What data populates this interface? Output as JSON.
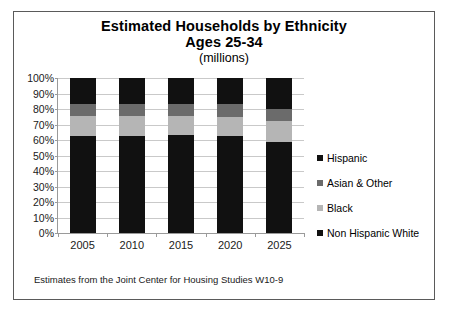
{
  "chart_data": {
    "type": "bar",
    "subtype": "stacked-percentage",
    "title": "Estimated Households by Ethnicity",
    "title_line2": "Ages 25-34",
    "subtitle": "(millions)",
    "xlabel": "",
    "ylabel": "",
    "categories": [
      "2005",
      "2010",
      "2015",
      "2020",
      "2025"
    ],
    "ylim": [
      0,
      100
    ],
    "ytick_labels": [
      "0%",
      "10%",
      "20%",
      "30%",
      "40%",
      "50%",
      "60%",
      "70%",
      "80%",
      "90%",
      "100%"
    ],
    "ytick_values": [
      0,
      10,
      20,
      30,
      40,
      50,
      60,
      70,
      80,
      90,
      100
    ],
    "grid": true,
    "legend_position": "right",
    "stack_order_bottom_to_top": [
      "Non Hispanic White",
      "Black",
      "Asian & Other",
      "Hispanic"
    ],
    "series": [
      {
        "name": "Non Hispanic White",
        "color": "#111111",
        "values": [
          62.5,
          62.5,
          63.0,
          62.5,
          58.5
        ]
      },
      {
        "name": "Black",
        "color": "#b5b5b5",
        "values": [
          13.0,
          13.0,
          12.5,
          12.5,
          13.5
        ]
      },
      {
        "name": "Asian & Other",
        "color": "#6b6b6b",
        "values": [
          7.5,
          7.5,
          8.0,
          8.0,
          8.0
        ]
      },
      {
        "name": "Hispanic",
        "color": "#111111",
        "values": [
          17.0,
          17.0,
          16.5,
          17.0,
          20.0
        ]
      }
    ],
    "annotations": [
      "Estimates from the Joint Center for Housing Studies W10-9"
    ]
  },
  "legend": {
    "items": [
      {
        "label": "Hispanic",
        "color": "#111111"
      },
      {
        "label": "Asian & Other",
        "color": "#6b6b6b"
      },
      {
        "label": "Black",
        "color": "#b5b5b5"
      },
      {
        "label": "Non Hispanic White",
        "color": "#111111"
      }
    ]
  },
  "footnote": "Estimates from the Joint Center for Housing Studies W10-9",
  "colors": {
    "frame_border": "#5a5a5a",
    "gridline": "#c9c9c9",
    "axis": "#9a9a9a",
    "text": "#1a1a1a",
    "background": "#ffffff"
  }
}
